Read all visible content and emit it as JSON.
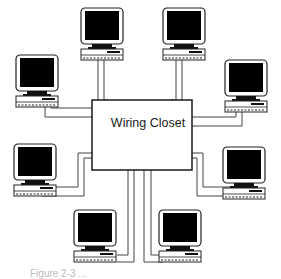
{
  "diagram": {
    "type": "star-topology-network",
    "center": {
      "label": "Wiring Closet"
    },
    "nodes": [
      {
        "id": "pc-top-left",
        "position": "top-left"
      },
      {
        "id": "pc-top-right",
        "position": "top-right"
      },
      {
        "id": "pc-upper-far-left",
        "position": "upper-far-left"
      },
      {
        "id": "pc-upper-far-right",
        "position": "upper-far-right"
      },
      {
        "id": "pc-lower-far-left",
        "position": "lower-far-left"
      },
      {
        "id": "pc-lower-far-right",
        "position": "lower-far-right"
      },
      {
        "id": "pc-bottom-left",
        "position": "bottom-left"
      },
      {
        "id": "pc-bottom-right",
        "position": "bottom-right"
      }
    ],
    "caption": "Figure 2-3 ..."
  },
  "colors": {
    "line": "#1a1a1a",
    "cable": "#555555",
    "screen": "#000000",
    "background": "#ffffff"
  }
}
